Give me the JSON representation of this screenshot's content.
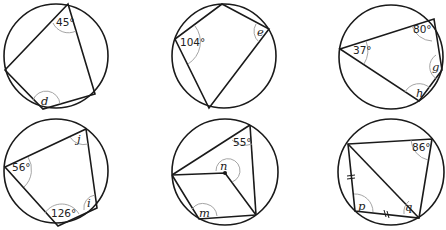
{
  "diagrams": [
    {
      "id": "a",
      "circle": {
        "cx": 56,
        "cy": 56,
        "r": 52
      },
      "quad": [
        [
          68,
          4
        ],
        [
          95,
          94
        ],
        [
          43,
          109
        ],
        [
          5,
          70
        ]
      ],
      "labels": {
        "top": "45°",
        "bottom": "d"
      }
    },
    {
      "id": "b",
      "circle": {
        "cx": 224,
        "cy": 56,
        "r": 52
      },
      "quad": [
        [
          222,
          4
        ],
        [
          269,
          29
        ],
        [
          209,
          108
        ],
        [
          175,
          39
        ]
      ],
      "labels": {
        "left": "104°",
        "right": "e"
      }
    },
    {
      "id": "c",
      "circle": {
        "cx": 391,
        "cy": 57,
        "r": 52
      },
      "quad": [
        [
          340,
          49
        ],
        [
          434,
          19
        ],
        [
          442,
          70
        ],
        [
          419,
          101
        ]
      ],
      "labels": {
        "left": "37°",
        "top_right": "80°",
        "right": "g",
        "bottom": "h"
      }
    },
    {
      "id": "d",
      "circle": {
        "cx": 56,
        "cy": 171,
        "r": 52
      },
      "quad": [
        [
          86,
          129
        ],
        [
          97,
          208
        ],
        [
          58,
          226
        ],
        [
          5,
          167
        ]
      ],
      "labels": {
        "left": "56°",
        "top_right": "j",
        "bottom": "126°",
        "right": "i"
      }
    },
    {
      "id": "e",
      "circle": {
        "cx": 225,
        "cy": 172,
        "r": 53
      },
      "triangle": [
        [
          250,
          125
        ],
        [
          256,
          215
        ],
        [
          172,
          175
        ]
      ],
      "center_point": [
        225,
        173
      ],
      "quad": [
        [
          172,
          175
        ],
        [
          225,
          173
        ],
        [
          256,
          215
        ],
        [
          199,
          219
        ]
      ],
      "labels": {
        "top_right": "55°",
        "center": "n",
        "bottom_left": "m"
      }
    },
    {
      "id": "f",
      "circle": {
        "cx": 391,
        "cy": 172,
        "r": 53
      },
      "quad": [
        [
          348,
          144
        ],
        [
          432,
          139
        ],
        [
          419,
          218
        ],
        [
          355,
          211
        ]
      ],
      "diagonal": [
        [
          348,
          144
        ],
        [
          419,
          218
        ]
      ],
      "labels": {
        "top_right": "86°",
        "bottom_left": "p",
        "bottom_mid": "q"
      },
      "equal_marks": "||"
    }
  ]
}
